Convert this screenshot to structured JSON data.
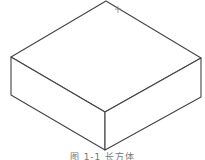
{
  "figure": {
    "type": "isometric-box",
    "stroke_color": "#444444",
    "fill_color": "#ffffff",
    "vertices": {
      "top_back": [
        106,
        1
      ],
      "top_left": [
        11,
        57
      ],
      "top_right": [
        201,
        58
      ],
      "top_front": [
        105,
        112
      ],
      "bottom_left": [
        11,
        95
      ],
      "bottom_right": [
        201,
        97
      ],
      "bottom_front": [
        105,
        150
      ]
    },
    "marker": "+"
  },
  "caption": {
    "text": "图 1-1  长方体"
  }
}
